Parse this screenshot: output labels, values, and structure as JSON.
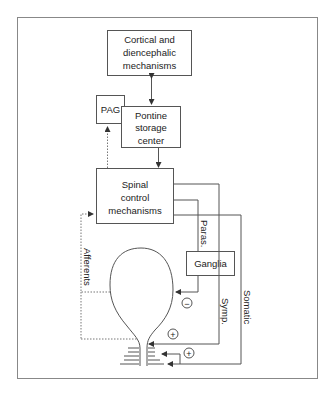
{
  "diagram": {
    "boxes": {
      "cortical": [
        "Cortical and",
        "diencephalic",
        "mechanisms"
      ],
      "pag": "PAG",
      "pontine": [
        "Pontine",
        "storage",
        "center"
      ],
      "spinal": [
        "Spinal",
        "control",
        "mechanisms"
      ],
      "ganglia": "Ganglia"
    },
    "labels": {
      "paras": "Paras.",
      "symp": "Symp.",
      "somatic": "Somatic",
      "afferents": "Afferents"
    },
    "signs": {
      "inhibit": "−",
      "excite_1": "+",
      "excite_2": "+"
    },
    "colors": {
      "line": "#555555",
      "text": "#222222",
      "background": "#ffffff"
    }
  }
}
